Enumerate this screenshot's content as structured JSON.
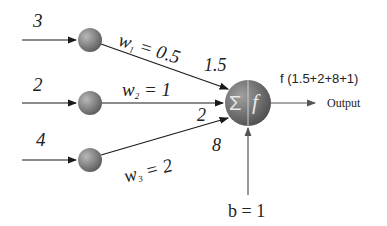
{
  "inputs": [
    {
      "value": "3",
      "weight_name": "w",
      "weight_sub": "1",
      "weight_value": "= 0.5",
      "product": "1.5"
    },
    {
      "value": "2",
      "weight_name": "w",
      "weight_sub": "2",
      "weight_value": "= 1",
      "product": "2"
    },
    {
      "value": "4",
      "weight_name": "w",
      "weight_sub": "3",
      "weight_value": "= 2",
      "product": "8"
    }
  ],
  "neuron": {
    "sum_symbol": "Σ",
    "activation_symbol": "f"
  },
  "bias": {
    "label": "b = 1"
  },
  "output": {
    "formula": "f (1.5+2+8+1)",
    "label": "Output"
  },
  "colors": {
    "line": "#1a1a1a",
    "node": "#7a7a7a",
    "neuron": "#6e6e6e"
  }
}
